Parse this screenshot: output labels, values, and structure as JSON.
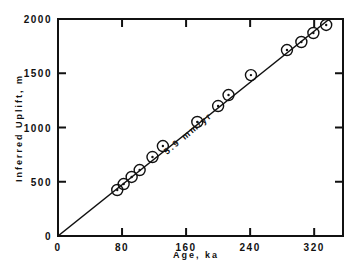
{
  "chart_data": {
    "type": "scatter",
    "title": "",
    "xlabel": "Age, ka",
    "ylabel": "Inferred Uplift, m",
    "xlim": [
      0,
      356
    ],
    "ylim": [
      0,
      2000
    ],
    "xticks": [
      "0",
      "80",
      "160",
      "240",
      "320"
    ],
    "yticks": [
      "0",
      "500",
      "1000",
      "1500",
      "2000"
    ],
    "grid": false,
    "legend": null,
    "annotation": "5.9  mm/yr",
    "fit_line": {
      "slope_m_per_ka": 5.9,
      "intercept": 0
    },
    "series": [
      {
        "name": "uplift",
        "x": [
          74,
          82,
          92,
          102,
          118,
          131,
          174,
          200,
          213,
          241,
          286,
          304,
          319,
          335
        ],
        "y": [
          424,
          479,
          544,
          608,
          728,
          829,
          1051,
          1198,
          1299,
          1483,
          1714,
          1788,
          1871,
          1945
        ]
      }
    ]
  }
}
